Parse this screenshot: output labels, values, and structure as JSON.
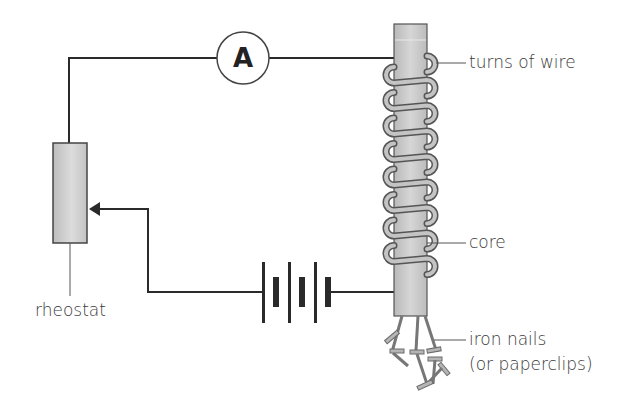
{
  "diagram": {
    "components": {
      "ammeter": {
        "symbol": "A"
      },
      "rheostat": {
        "label": "rheostat"
      },
      "battery": {
        "cells": 3
      },
      "electromagnet": {
        "coil_turns": 8
      }
    },
    "labels": {
      "turns_of_wire": "turns of wire",
      "core": "core",
      "iron_nails_line1": "iron nails",
      "iron_nails_line2": "(or paperclips)",
      "rheostat": "rheostat"
    },
    "colors": {
      "wire": "#2a2a2a",
      "core_fill": "#c8c8c8",
      "coil_fill": "#b8b8b8",
      "coil_stroke": "#555555",
      "label_text": "#3a3a3a"
    }
  }
}
